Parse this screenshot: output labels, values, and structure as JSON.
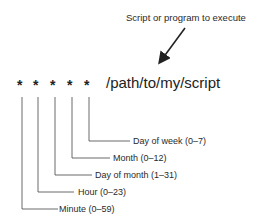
{
  "annotation": {
    "text": "Script or program to execute"
  },
  "command": {
    "fields": [
      "*",
      "*",
      "*",
      "*",
      "*"
    ],
    "path": "/path/to/my/script"
  },
  "fields": [
    {
      "label": "Minute (0–59)"
    },
    {
      "label": "Hour (0–23)"
    },
    {
      "label": "Day of month (1–31)"
    },
    {
      "label": "Month (0–12)"
    },
    {
      "label": "Day of week (0–7)"
    }
  ]
}
